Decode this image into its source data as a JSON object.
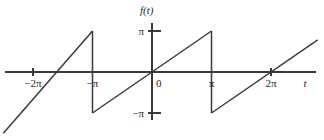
{
  "figure": {
    "title": "",
    "background_color": "#ffffff",
    "line_color": "#3a3a3a",
    "text_color": "#2b2b2b"
  },
  "chart_data": {
    "type": "line",
    "title": "",
    "subtitle": "",
    "xlabel": "t",
    "ylabel": "f(t)",
    "grid": false,
    "legend": null,
    "xlim": [
      -7.85,
      8.75
    ],
    "ylim": [
      -3.95,
      3.95
    ],
    "period": 6.2832,
    "amplitude": 3.1416,
    "x_ticks": [
      {
        "value": -6.2832,
        "label": "−2π"
      },
      {
        "value": -3.1416,
        "label": "−π"
      },
      {
        "value": 0,
        "label": "0"
      },
      {
        "value": 3.1416,
        "label": "π"
      },
      {
        "value": 6.2832,
        "label": "2π"
      }
    ],
    "y_ticks": [
      {
        "value": 3.1416,
        "label": "π"
      },
      {
        "value": -3.1416,
        "label": "−π"
      }
    ],
    "series": [
      {
        "name": "f(t)",
        "color": "#3a3a3a",
        "segments": [
          {
            "x": [
              -7.85,
              -3.1416
            ],
            "y": [
              -4.7,
              3.1416
            ]
          },
          {
            "x": [
              -3.1416,
              -3.1416
            ],
            "y": [
              3.1416,
              -3.1416
            ]
          },
          {
            "x": [
              -3.1416,
              3.1416
            ],
            "y": [
              -3.1416,
              3.1416
            ]
          },
          {
            "x": [
              3.1416,
              3.1416
            ],
            "y": [
              3.1416,
              -3.1416
            ]
          },
          {
            "x": [
              3.1416,
              8.75
            ],
            "y": [
              -3.1416,
              2.46
            ]
          }
        ]
      }
    ]
  },
  "axis_labels": {
    "y_axis": "f(t)",
    "x_axis": "t",
    "origin": "0",
    "pi_positive": "π",
    "pi_negative": "−π",
    "two_pi_positive": "2π",
    "two_pi_negative": "−2π"
  }
}
